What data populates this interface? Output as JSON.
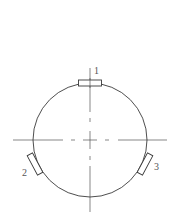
{
  "diagram": {
    "colors": {
      "line": "#3a3a3a",
      "centerline": "#555555",
      "label": "#555555",
      "background": "#ffffff"
    },
    "circle": {
      "cx": 90,
      "cy": 140,
      "r": 57
    },
    "labels": [
      {
        "id": "1",
        "text": "1"
      },
      {
        "id": "2",
        "text": "2"
      },
      {
        "id": "3",
        "text": "3"
      }
    ]
  }
}
